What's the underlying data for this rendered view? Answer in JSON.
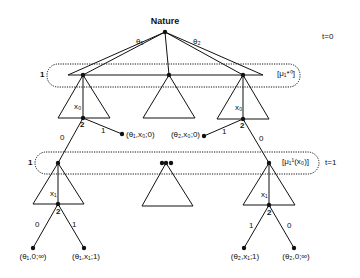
{
  "title": "Nature",
  "time_labels": {
    "t0": "t=0",
    "t1": "t=1"
  },
  "nature_branches": {
    "theta1": "θ₁",
    "theta2": "θ₂"
  },
  "info_sets": {
    "level1": {
      "player": "1",
      "belief": "[μ₁*⁰]"
    },
    "level2": {
      "player": "1",
      "belief": "[μ₁¹(x₀)]"
    }
  },
  "level1_nodes": {
    "left": {
      "action": "x₀",
      "responder": "2",
      "branch_0": "0",
      "branch_1": "1",
      "terminal": "(θ₁,x₀;0)"
    },
    "right": {
      "action": "x₀",
      "responder": "2",
      "branch_0": "0",
      "branch_1": "1",
      "terminal": "(θ₂,x₀;0)"
    }
  },
  "level2_nodes": {
    "left": {
      "action": "x₁",
      "responder": "2",
      "branch_0": "0",
      "branch_1": "1",
      "terminal_0": "(θ₁,0;∞)",
      "terminal_1": "(θ₁,x₁;1)"
    },
    "right": {
      "action": "x₁",
      "responder": "2",
      "branch_0": "0",
      "branch_1": "1",
      "terminal_0": "(θ₂,0;∞)",
      "terminal_1": "(θ₂,x₁;1)"
    }
  },
  "colors": {
    "ink": "#111111",
    "background": "#ffffff"
  }
}
